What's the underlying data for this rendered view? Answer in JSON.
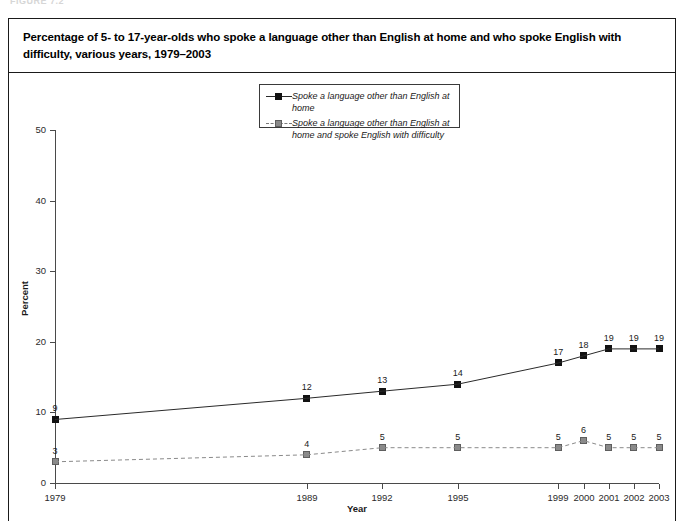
{
  "figure_tag": "FIGURE 7.2",
  "title": "Percentage of 5- to 17-year-olds who spoke a language other than English at home and who spoke English with difficulty, various years, 1979–2003",
  "axis": {
    "y_title": "Percent",
    "x_title": "Year"
  },
  "legend": {
    "items": [
      {
        "label": "Spoke a language other than English at home",
        "marker": "black-square",
        "line": "solid"
      },
      {
        "label": "Spoke a language other than English at home and spoke English with difficulty",
        "marker": "gray-square",
        "line": "dashed"
      }
    ]
  },
  "chart_data": {
    "type": "line",
    "title": "Percentage of 5- to 17-year-olds who spoke a language other than English at home and who spoke English with difficulty, various years, 1979–2003",
    "xlabel": "Year",
    "ylabel": "Percent",
    "ylim": [
      0,
      50
    ],
    "yticks": [
      0,
      10,
      20,
      30,
      40,
      50
    ],
    "grid": false,
    "legend_position": "top-center",
    "categories": [
      "1979",
      "1989",
      "1992",
      "1995",
      "1999",
      "2000",
      "2001",
      "2002",
      "2003"
    ],
    "x": [
      1979,
      1989,
      1992,
      1995,
      1999,
      2000,
      2001,
      2002,
      2003
    ],
    "series": [
      {
        "name": "Spoke a language other than English at home",
        "values": [
          9,
          12,
          13,
          14,
          17,
          18,
          19,
          19,
          19
        ],
        "color": "#121212",
        "line": "solid",
        "marker": "square"
      },
      {
        "name": "Spoke a language other than English at home and spoke English with difficulty",
        "values": [
          3,
          4,
          5,
          5,
          5,
          6,
          5,
          5,
          5
        ],
        "color": "#8a8a8a",
        "line": "dashed",
        "marker": "square"
      }
    ]
  }
}
